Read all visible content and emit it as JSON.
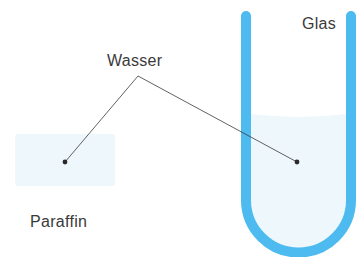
{
  "diagram": {
    "labels": {
      "water": "Wasser",
      "paraffin": "Paraffin",
      "glass": "Glas"
    },
    "colors": {
      "glass_tube": "#4dbbef",
      "water_fill": "#eef7fc",
      "leader_line": "#3a3a3a",
      "text": "#3a3a3a",
      "background": "#ffffff"
    }
  }
}
